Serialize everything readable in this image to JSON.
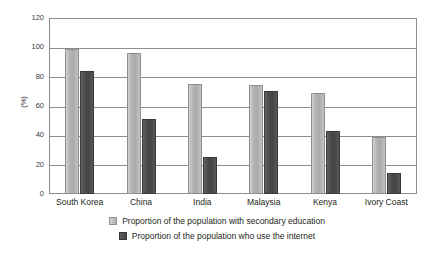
{
  "chart_data": {
    "type": "bar",
    "title": "",
    "subtitle": "",
    "xlabel": "",
    "ylabel": "(%)",
    "ylim": [
      0,
      120
    ],
    "ytick_step": 20,
    "yticks": [
      0,
      20,
      40,
      60,
      80,
      100,
      120
    ],
    "ytick_labels": [
      "0",
      "20",
      "40",
      "60",
      "80",
      "100",
      "120"
    ],
    "grid": "horizontal",
    "legend_position": "bottom",
    "categories": [
      "South Korea",
      "China",
      "India",
      "Malaysia",
      "Kenya",
      "Ivory Coast"
    ],
    "series": [
      {
        "name": "Proportion of the population with secondary education",
        "color": "#b5b5b5",
        "values": [
          99,
          96,
          75,
          74,
          69,
          39
        ]
      },
      {
        "name": "Proportion of the population who use the internet",
        "color": "#4b4b4b",
        "values": [
          84,
          51,
          25,
          70,
          43,
          14
        ]
      }
    ],
    "annotations": []
  },
  "axis": {
    "y_title": "(%)"
  },
  "legend": {
    "items": [
      {
        "label": "Proportion of the population with secondary education",
        "swatch": "light-gray-square"
      },
      {
        "label": "Proportion of the population who use the internet",
        "swatch": "dark-gray-square"
      }
    ]
  }
}
